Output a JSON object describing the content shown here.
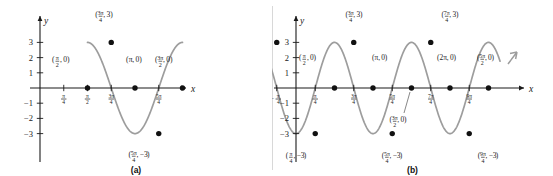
{
  "figure": {
    "panels": [
      {
        "id": "a",
        "caption": "(a)",
        "axis_x_label": "x",
        "axis_y_label": "y",
        "y_ticks": [
          "3",
          "2",
          "1",
          "-1",
          "-2",
          "-3"
        ],
        "x_ticks": [
          "π/4",
          "π/2",
          "3π/4",
          "5π/4"
        ],
        "point_labels": [
          "(π/2, 0)",
          "(3π/4, 3)",
          "(π, 0)",
          "(5π/4, -3)",
          "(3π/2, 0)"
        ]
      },
      {
        "id": "b",
        "caption": "(b)",
        "axis_x_label": "x",
        "axis_y_label": "y",
        "y_ticks": [
          "3",
          "2",
          "1",
          "-1",
          "-2",
          "-3"
        ],
        "x_ticks": [
          "-π/4",
          "π/4",
          "3π/4",
          "5π/4",
          "7π/4",
          "9π/4"
        ],
        "point_labels": [
          "(-π/2, 0)",
          "(-π/4, 3)",
          "(π/4, -3)",
          "(π/2, 0)",
          "(3π/4, 3)",
          "(π, 0)",
          "(5π/4, -3)",
          "(3π/2, 0)",
          "(7π/4, 3)",
          "(2π, 0)",
          "(9π/4, -3)",
          "(5π/2, 0)"
        ]
      }
    ]
  },
  "chart_data": [
    {
      "type": "line",
      "title": "(a)",
      "xlabel": "x",
      "ylabel": "y",
      "ylim": [
        -3.6,
        3.6
      ],
      "xlim_pi": [
        0.0,
        1.75
      ],
      "grid": false,
      "legend": "none",
      "y_tick_values": [
        3,
        2,
        1,
        -1,
        -2,
        -3
      ],
      "x_tick_labels": [
        "π/4",
        "π/2",
        "3π/4",
        "5π/4"
      ],
      "x_tick_values_pi": [
        0.25,
        0.5,
        0.75,
        1.25
      ],
      "series": [
        {
          "name": "y = 3 sin(2x - π/2)",
          "amplitude": 3,
          "period_pi": 1.0,
          "x_start_pi": 0.5,
          "x_end_pi": 1.5
        }
      ],
      "annotated_points": [
        {
          "label": "(π/2, 0)",
          "x_pi": 0.5,
          "y": 0
        },
        {
          "label": "(3π/4, 3)",
          "x_pi": 0.75,
          "y": 3
        },
        {
          "label": "(π, 0)",
          "x_pi": 1.0,
          "y": 0
        },
        {
          "label": "(5π/4, -3)",
          "x_pi": 1.25,
          "y": -3
        },
        {
          "label": "(3π/2, 0)",
          "x_pi": 1.5,
          "y": 0
        }
      ]
    },
    {
      "type": "line",
      "title": "(b)",
      "xlabel": "x",
      "ylabel": "y",
      "ylim": [
        -3.6,
        3.6
      ],
      "xlim_pi": [
        -0.75,
        2.75
      ],
      "grid": false,
      "legend": "none",
      "y_tick_values": [
        3,
        2,
        1,
        -1,
        -2,
        -3
      ],
      "x_tick_labels": [
        "-π/4",
        "π/4",
        "3π/4",
        "5π/4",
        "7π/4",
        "9π/4"
      ],
      "x_tick_values_pi": [
        -0.25,
        0.25,
        0.75,
        1.25,
        1.75,
        2.25
      ],
      "series": [
        {
          "name": "y = 3 sin(2x - π/2)",
          "amplitude": 3,
          "period_pi": 1.0,
          "x_start_pi": -0.6,
          "x_end_pi": 2.65
        }
      ],
      "annotated_points": [
        {
          "label": "(-π/2, 0)",
          "x_pi": -0.5,
          "y": 0
        },
        {
          "label": "(-π/4, 3)",
          "x_pi": -0.25,
          "y": 3
        },
        {
          "label": "(π/4, -3)",
          "x_pi": 0.25,
          "y": -3
        },
        {
          "label": "(π/2, 0)",
          "x_pi": 0.5,
          "y": 0
        },
        {
          "label": "(3π/4, 3)",
          "x_pi": 0.75,
          "y": 3
        },
        {
          "label": "(π, 0)",
          "x_pi": 1.0,
          "y": 0
        },
        {
          "label": "(5π/4, -3)",
          "x_pi": 1.25,
          "y": -3
        },
        {
          "label": "(3π/2, 0)",
          "x_pi": 1.5,
          "y": 0
        },
        {
          "label": "(7π/4, 3)",
          "x_pi": 1.75,
          "y": 3
        },
        {
          "label": "(2π, 0)",
          "x_pi": 2.0,
          "y": 0
        },
        {
          "label": "(9π/4, -3)",
          "x_pi": 2.25,
          "y": -3
        },
        {
          "label": "(5π/2, 0)",
          "x_pi": 2.5,
          "y": 0
        }
      ]
    }
  ]
}
